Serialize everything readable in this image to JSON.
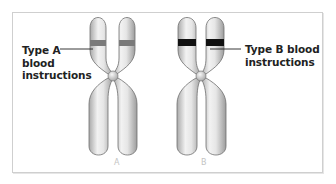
{
  "figure": {
    "chromosomes": [
      {
        "id": "A",
        "caption": "A",
        "band_color": "#7a7a7a",
        "label_lines": [
          "Type A",
          "blood",
          "instructions"
        ]
      },
      {
        "id": "B",
        "caption": "B",
        "band_color": "#111111",
        "label_lines": [
          "Type B blood",
          "instructions"
        ]
      }
    ],
    "colors": {
      "chromatid_fill": "#d8d8d8",
      "chromatid_highlight": "#f4f4f4",
      "chromatid_outline": "#6e6e6e",
      "frame_border": "#cfcfcf",
      "caption": "#c4c4c4"
    }
  }
}
